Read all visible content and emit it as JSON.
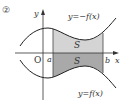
{
  "figure": {
    "number_label": "②",
    "origin_label": "O",
    "x_axis_label": "x",
    "y_axis_label": "y",
    "a_label": "a",
    "b_label": "b",
    "upper_curve_label": "y=−f(x)",
    "lower_curve_label": "y=f(x)",
    "upper_area_label": "S",
    "lower_area_label": "S"
  },
  "colors": {
    "curve": "#222222",
    "axis": "#333333",
    "upper_fill": "#d4d4d4",
    "lower_fill": "#a9a9a9",
    "text": "#333333"
  }
}
